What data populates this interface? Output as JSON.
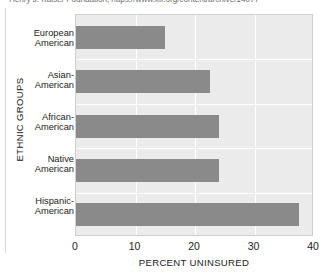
{
  "caption": {
    "source_note": "Henry J. Kaiser Foundation, https://www.kff.org/content/archive/14077"
  },
  "chart_data": {
    "type": "bar",
    "orientation": "horizontal",
    "title": "",
    "subtitle": "",
    "xlabel": "PERCENT UNINSURED",
    "ylabel": "ETHNIC GROUPS",
    "categories": [
      "European American",
      "Asian-American",
      "African-American",
      "Native American",
      "Hispanic-American"
    ],
    "category_lines": [
      [
        "European",
        "American"
      ],
      [
        "Asian-",
        "American"
      ],
      [
        "African-",
        "American"
      ],
      [
        "Native",
        "American"
      ],
      [
        "Hispanic-",
        "American"
      ]
    ],
    "values": [
      15,
      22.5,
      24,
      24,
      37.5
    ],
    "xlim": [
      0,
      40
    ],
    "xticks": [
      0,
      10,
      20,
      30,
      40
    ],
    "xtick_labels": [
      "0",
      "10",
      "20",
      "30",
      "40"
    ],
    "grid": true,
    "legend": "none",
    "colors": {
      "bar": "#8a8a8a",
      "plot_background": "#ebebeb",
      "gridline": "#ffffff",
      "text": "#1b1b1b",
      "page_background": "#ffffff"
    }
  }
}
